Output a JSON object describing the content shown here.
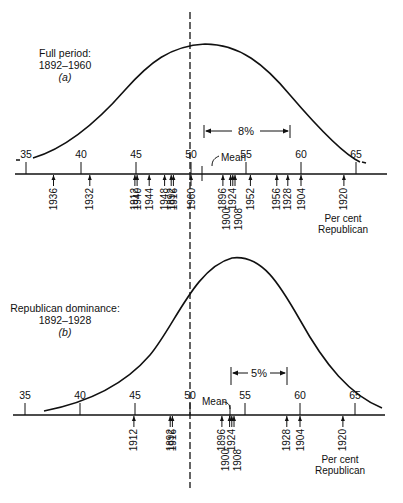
{
  "chart_data": [
    {
      "type": "line",
      "panel": "a",
      "title": "Full period: 1892-1960",
      "panel_letter": "(a)",
      "xlabel": "Per cent Republican",
      "xlim": [
        35,
        65
      ],
      "xticks": [
        35,
        40,
        45,
        50,
        55,
        60,
        65
      ],
      "curve": "normal distribution of per cent Republican vote",
      "mean": 51.5,
      "reference_line_x": 50,
      "range_annotation": {
        "label": "8%",
        "from": 51.5,
        "to": 59.5
      },
      "mean_label": "Mean",
      "elections": [
        {
          "year": "1936",
          "value": 37.5
        },
        {
          "year": "1932",
          "value": 40.8
        },
        {
          "year": "1912",
          "value": 44.9
        },
        {
          "year": "1940",
          "value": 45.1
        },
        {
          "year": "1944",
          "value": 46.2
        },
        {
          "year": "1948",
          "value": 47.6
        },
        {
          "year": "1892",
          "value": 48.2
        },
        {
          "year": "1916",
          "value": 48.4
        },
        {
          "year": "1960",
          "value": 50.0
        },
        {
          "year": "1896",
          "value": 52.9
        },
        {
          "year": "1900",
          "value": 53.6
        },
        {
          "year": "1924",
          "value": 53.8
        },
        {
          "year": "1908",
          "value": 54.0
        },
        {
          "year": "1952",
          "value": 55.4
        },
        {
          "year": "1956",
          "value": 57.8
        },
        {
          "year": "1928",
          "value": 58.8
        },
        {
          "year": "1904",
          "value": 60.0
        },
        {
          "year": "1920",
          "value": 63.9
        }
      ]
    },
    {
      "type": "line",
      "panel": "b",
      "title": "Republican dominance: 1892-1928",
      "panel_letter": "(b)",
      "xlabel": "Per cent Republican",
      "xlim": [
        35,
        65
      ],
      "xticks": [
        35,
        40,
        45,
        50,
        55,
        60,
        65
      ],
      "curve": "normal distribution of per cent Republican vote",
      "mean": 53.6,
      "reference_line_x": 50,
      "range_annotation": {
        "label": "5%",
        "from": 53.6,
        "to": 58.6
      },
      "mean_label": "Mean",
      "elections": [
        {
          "year": "1912",
          "value": 44.9
        },
        {
          "year": "1892",
          "value": 48.2
        },
        {
          "year": "1916",
          "value": 48.4
        },
        {
          "year": "1896",
          "value": 52.9
        },
        {
          "year": "1900",
          "value": 53.6
        },
        {
          "year": "1924",
          "value": 53.8
        },
        {
          "year": "1908",
          "value": 54.0
        },
        {
          "year": "1928",
          "value": 58.8
        },
        {
          "year": "1904",
          "value": 60.0
        },
        {
          "year": "1920",
          "value": 63.9
        }
      ]
    }
  ],
  "panel_a": {
    "title_line1": "Full period:",
    "title_line2": "1892–1960",
    "letter": "(a)",
    "range_label": "8%",
    "mean_label": "Mean",
    "axis_label_line1": "Per cent",
    "axis_label_line2": "Republican"
  },
  "panel_b": {
    "title_line1": "Republican dominance:",
    "title_line2": "1892–1928",
    "letter": "(b)",
    "range_label": "5%",
    "mean_label": "Mean",
    "axis_label_line1": "Per cent",
    "axis_label_line2": "Republican"
  },
  "ticks": [
    "35",
    "40",
    "45",
    "50",
    "55",
    "60",
    "65"
  ]
}
